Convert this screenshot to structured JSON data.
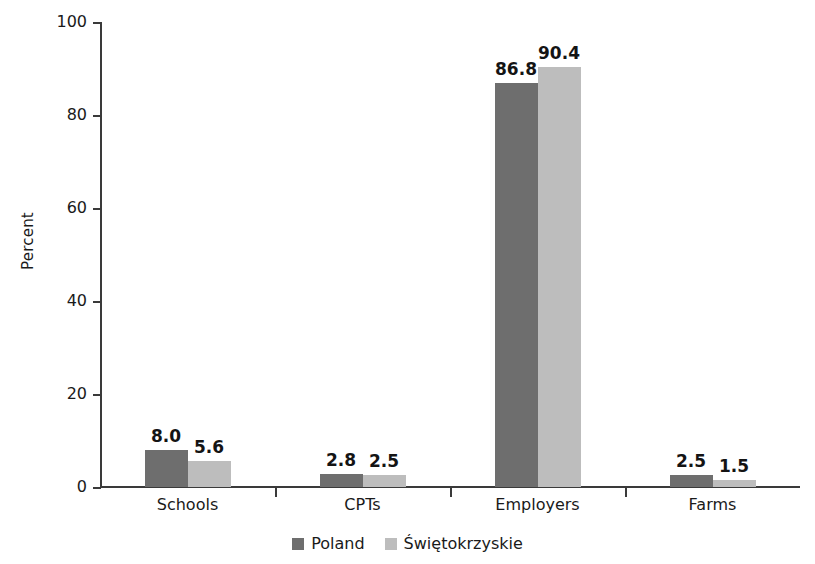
{
  "chart_data": {
    "type": "bar",
    "title": "",
    "subtitle": "",
    "xlabel": "",
    "ylabel": "Percent",
    "ylim": [
      0,
      100
    ],
    "yticks": [
      0,
      20,
      40,
      60,
      80,
      100
    ],
    "ytick_labels": [
      "0",
      "20",
      "40",
      "60",
      "80",
      "100"
    ],
    "grid": false,
    "legend_position": "bottom-center",
    "categories": [
      "Schools",
      "CPTs",
      "Employers",
      "Farms"
    ],
    "series": [
      {
        "name": "Poland",
        "color": "#6e6e6e",
        "values": [
          8.0,
          2.8,
          86.8,
          2.5
        ],
        "value_labels": [
          "8.0",
          "2.8",
          "86.8",
          "2.5"
        ]
      },
      {
        "name": "Świętokrzyskie",
        "color": "#bdbdbd",
        "values": [
          5.6,
          2.5,
          90.4,
          1.5
        ],
        "value_labels": [
          "5.6",
          "2.5",
          "90.4",
          "1.5"
        ]
      }
    ]
  },
  "legend": {
    "items": [
      {
        "label": "Poland",
        "color": "#6e6e6e"
      },
      {
        "label": "Świętokrzyskie",
        "color": "#bdbdbd"
      }
    ]
  },
  "axis": {
    "y_title": "Percent",
    "y_tick_labels": [
      "100",
      "80",
      "60",
      "40",
      "20",
      "0"
    ],
    "x_tick_labels": [
      "Schools",
      "CPTs",
      "Employers",
      "Farms"
    ]
  },
  "colors": {
    "series_dark": "#6e6e6e",
    "series_light": "#bdbdbd",
    "axis": "#3a3a3a",
    "text": "#1a1a1a",
    "background": "#ffffff"
  }
}
